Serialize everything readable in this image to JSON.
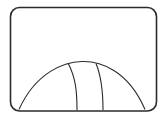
{
  "diagram": {
    "kind": "line-drawing",
    "colors": {
      "background": "#ffffff",
      "stroke": "#2b2b2b"
    },
    "frame": {
      "x": 10.5,
      "y": 7.5,
      "width": 146,
      "height": 103.5,
      "corner_radius": 9,
      "stroke_width": 1.6
    },
    "dome": {
      "path": "M19,109.5 C36,72 64,62 82,61.5 C100,61 128,70 145,109.5",
      "stroke_width": 1.1
    },
    "seams": [
      {
        "path": "M68,63 C76,78 77,93 77,110",
        "stroke_width": 1.1
      },
      {
        "path": "M96,63.5 C102,78 103,93 103,110",
        "stroke_width": 1.1
      }
    ]
  }
}
